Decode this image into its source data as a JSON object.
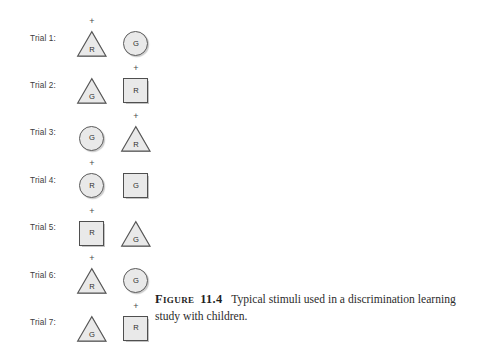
{
  "figure": {
    "background_color": "#ffffff",
    "shape_fill_color": "#e9e9e9",
    "shape_stroke_color": "#4f4f4f",
    "text_color": "#2e2e2e"
  },
  "trials": [
    {
      "label": "Trial 1:",
      "stimuli": [
        {
          "shape": "triangle",
          "letter": "R",
          "marker": "+",
          "marked": true
        },
        {
          "shape": "circle",
          "letter": "G",
          "marker": "",
          "marked": false
        }
      ]
    },
    {
      "label": "Trial 2:",
      "stimuli": [
        {
          "shape": "triangle",
          "letter": "G",
          "marker": "",
          "marked": false
        },
        {
          "shape": "square",
          "letter": "R",
          "marker": "+",
          "marked": true
        }
      ]
    },
    {
      "label": "Trial 3:",
      "stimuli": [
        {
          "shape": "circle",
          "letter": "G",
          "marker": "",
          "marked": false
        },
        {
          "shape": "triangle",
          "letter": "R",
          "marker": "+",
          "marked": true
        }
      ]
    },
    {
      "label": "Trial 4:",
      "stimuli": [
        {
          "shape": "circle",
          "letter": "R",
          "marker": "+",
          "marked": true
        },
        {
          "shape": "square",
          "letter": "G",
          "marker": "",
          "marked": false
        }
      ]
    },
    {
      "label": "Trial 5:",
      "stimuli": [
        {
          "shape": "square",
          "letter": "R",
          "marker": "+",
          "marked": true
        },
        {
          "shape": "triangle",
          "letter": "G",
          "marker": "",
          "marked": false
        }
      ]
    },
    {
      "label": "Trial 6:",
      "stimuli": [
        {
          "shape": "triangle",
          "letter": "R",
          "marker": "+",
          "marked": true
        },
        {
          "shape": "circle",
          "letter": "G",
          "marker": "",
          "marked": false
        }
      ]
    },
    {
      "label": "Trial 7:",
      "stimuli": [
        {
          "shape": "triangle",
          "letter": "G",
          "marker": "",
          "marked": false
        },
        {
          "shape": "square",
          "letter": "R",
          "marker": "+",
          "marked": true
        }
      ]
    }
  ],
  "caption": {
    "head": "Figure",
    "number": "11.4",
    "body": "Typical stimuli used in a discrimination learning study with children."
  }
}
